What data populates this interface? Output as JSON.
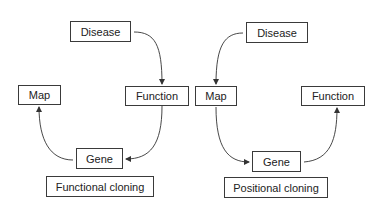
{
  "left_diagram": {
    "disease": "Disease",
    "function": "Function",
    "map": "Map",
    "gene": "Gene",
    "caption": "Functional cloning",
    "flow": [
      "Disease",
      "Function",
      "Gene",
      "Map"
    ]
  },
  "right_diagram": {
    "disease": "Disease",
    "map": "Map",
    "gene": "Gene",
    "function": "Function",
    "caption": "Positional cloning",
    "flow": [
      "Disease",
      "Map",
      "Gene",
      "Function"
    ]
  },
  "colors": {
    "stroke": "#333333",
    "text": "#222222",
    "background": "#ffffff"
  }
}
